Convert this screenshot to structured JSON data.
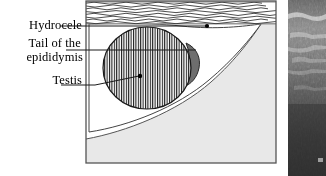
{
  "figure": {
    "width": 326,
    "height": 176,
    "background": "#ffffff"
  },
  "labels": [
    {
      "id": "hydrocele",
      "text": "Hydrocele",
      "line2": ""
    },
    {
      "id": "epididymis",
      "text": "Tail of  the",
      "line2": "epididymis"
    },
    {
      "id": "testis",
      "text": "Testis",
      "line2": ""
    }
  ],
  "label_text": {
    "hydrocele": "Hydrocele",
    "epididymis_line1": "Tail of  the",
    "epididymis_line2": "epididymis",
    "testis": "Testis"
  },
  "leaders": [
    {
      "name": "hydrocele-leader",
      "from_x": 60,
      "from_y": 26,
      "to_x": 208,
      "to_y": 26,
      "dot": true
    },
    {
      "name": "epididymis-leader",
      "from_x": 66,
      "from_y": 50,
      "to_x": 174,
      "to_y": 50,
      "dot": false
    },
    {
      "name": "testis-leader",
      "from_x": 61,
      "from_y": 84,
      "to_x": 141,
      "to_y": 76,
      "dot": true
    }
  ],
  "diagram": {
    "panel": {
      "x": 85,
      "y": 0,
      "width": 192,
      "height": 164
    },
    "border_color": "#555555",
    "regions": [
      {
        "name": "scrotal-wall-band",
        "description": "wavy horizontal hatched band across the top",
        "fill": "#ffffff",
        "stroke": "#333333",
        "y_top": 2,
        "y_bottom": 24
      },
      {
        "name": "hydrocele-fluid",
        "description": "white fluid collection surrounding the testis, tapering to a point at right",
        "fill": "#ffffff",
        "stroke": "#444444"
      },
      {
        "name": "surrounding-tissue",
        "description": "light grey tissue filling the lower right of the frame",
        "fill": "#e8e8e8",
        "stroke": "#555555"
      },
      {
        "name": "testis",
        "description": "oval organ with fine vertical hatching",
        "fill": "#ffffff",
        "hatch": "#222222",
        "stroke": "#1a1a1a",
        "cx": 62,
        "cy": 68,
        "rx": 44,
        "ry": 41
      },
      {
        "name": "tail-of-epididymis",
        "description": "dark grey crescent on the right border of the testis",
        "fill": "#6e6e6e",
        "stroke": "#2a2a2a"
      }
    ]
  },
  "ultrasound": {
    "name": "ultrasound-image-strip",
    "x": 288,
    "y": 0,
    "width": 38,
    "height": 176,
    "description": "grayscale ultrasound scan strip with speckle texture and bright horizontal streaks",
    "base_color": "#4a4a4a",
    "bright_streak_color": "#d8d8d8",
    "dark_color": "#2b2b2b"
  },
  "colors": {
    "ink": "#000000",
    "frame": "#555555",
    "tissue_grey": "#e8e8e8",
    "epididymis_grey": "#6e6e6e",
    "paper": "#ffffff"
  }
}
